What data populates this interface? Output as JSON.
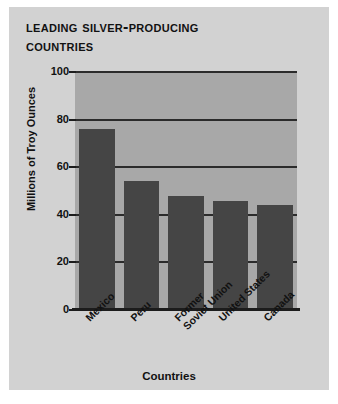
{
  "figure": {
    "title_lines": [
      "Leading Silver-Producing",
      "Countries"
    ],
    "background_color": "#d2d2d2",
    "plot_background_color": "#a8a8a8",
    "bar_color": "#454545",
    "axis_color": "#1c1c1c"
  },
  "chart_data": {
    "type": "bar",
    "categories": [
      "Mexico",
      "Peru",
      "Former\nSoviet Union",
      "United States",
      "Canada"
    ],
    "category_labels_flat": [
      "Mexico",
      "Peru",
      "Former Soviet Union",
      "United States",
      "Canada"
    ],
    "values": [
      76,
      54,
      48,
      46,
      44
    ],
    "xlabel": "Countries",
    "ylabel": "Millions of Troy Ounces",
    "ylim": [
      0,
      100
    ],
    "yticks": [
      0,
      20,
      40,
      60,
      80,
      100
    ],
    "ytick_labels": [
      "0",
      "20",
      "40",
      "60",
      "80",
      "100"
    ],
    "grid": true,
    "grid_axis": "y",
    "legend": null
  }
}
